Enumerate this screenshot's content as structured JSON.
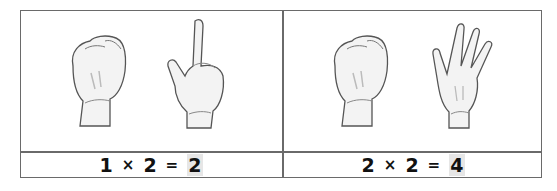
{
  "cards": [
    {
      "hands": [
        {
          "name": "closed-fist",
          "fingers": 0
        },
        {
          "name": "one-finger",
          "fingers": 1
        }
      ],
      "equation": {
        "a": "1",
        "times": "×",
        "b": "2",
        "equals": "=",
        "result": "2"
      }
    },
    {
      "hands": [
        {
          "name": "closed-fist",
          "fingers": 0
        },
        {
          "name": "four-fingers",
          "fingers": 4
        }
      ],
      "equation": {
        "a": "2",
        "times": "×",
        "b": "2",
        "equals": "=",
        "result": "4"
      }
    }
  ]
}
